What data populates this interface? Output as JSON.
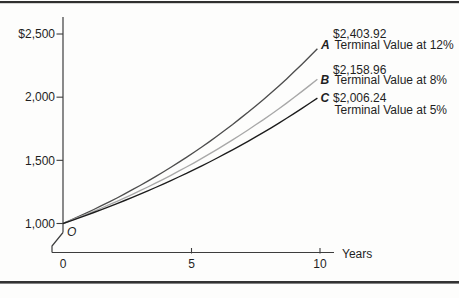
{
  "figure": {
    "background": "#fdfdfc",
    "rule_color": "#2f2f2f",
    "axis_color": "#3d3d3d",
    "text_color": "#1f1f1f"
  },
  "chart_data": {
    "type": "line",
    "title": "",
    "xlabel": "Years",
    "ylabel": "",
    "x_ticks": [
      0,
      5,
      10
    ],
    "y_tick_labels": [
      "$2,500",
      "2,000",
      "1,500",
      "1,000"
    ],
    "y_tick_values": [
      2500,
      2000,
      1500,
      1000
    ],
    "xlim": [
      0,
      10.5
    ],
    "ylim": [
      1000,
      2600
    ],
    "grid": false,
    "axis_break_at_origin": true,
    "origin_label": "O",
    "initial_value": 1000,
    "years_span": 10,
    "series": [
      {
        "id": "A",
        "rate": "12%",
        "value_label": "$2,403.92",
        "name": "Terminal Value at 12%",
        "terminal_value": 2403.92,
        "start_value": 1000,
        "color": "#4d4d4d"
      },
      {
        "id": "B",
        "rate": "8%",
        "value_label": "$2,158.96",
        "name": "Terminal Value at 8%",
        "terminal_value": 2158.96,
        "start_value": 1000,
        "color": "#a8a8a8"
      },
      {
        "id": "C",
        "rate": "5%",
        "value_label": "$2,006.24",
        "name": "Terminal Value at 5%",
        "terminal_value": 2006.24,
        "start_value": 1000,
        "color": "#1c1c1c"
      }
    ]
  }
}
